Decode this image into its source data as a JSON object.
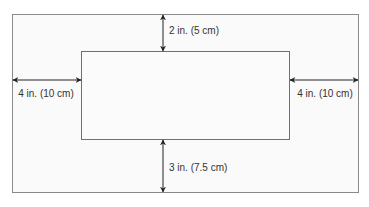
{
  "diagram": {
    "type": "margin-layout",
    "colors": {
      "outer_fill": "#fafafa",
      "outer_stroke": "#8a8a8a",
      "inner_fill": "#fbfbfb",
      "inner_stroke": "#707070",
      "arrow": "#222222",
      "text": "#333333"
    },
    "outer_rect": {
      "x": 12,
      "y": 14,
      "width": 347,
      "height": 179
    },
    "inner_rect": {
      "x": 81,
      "y": 51,
      "width": 209,
      "height": 89
    },
    "dimensions": {
      "top": {
        "label": "2 in. (5 cm)"
      },
      "left": {
        "label": "4 in. (10 cm)"
      },
      "right": {
        "label": "4 in. (10 cm)"
      },
      "bottom": {
        "label": "3 in. (7.5 cm)"
      }
    }
  }
}
